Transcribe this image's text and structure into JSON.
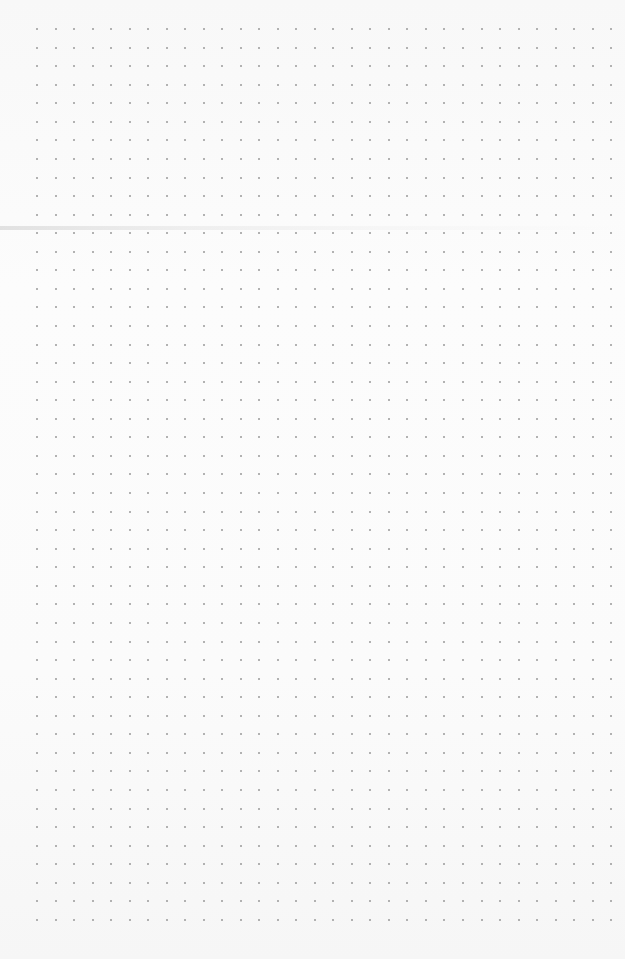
{
  "page": {
    "type": "dot-grid-paper",
    "background_color": "#fbfbfb",
    "dot_color": "#9a9a9a"
  },
  "grid": {
    "columns": 32,
    "rows": 49,
    "origin_x": 37,
    "origin_y": 29,
    "spacing_x": 18.52,
    "spacing_y": 18.56,
    "dot_size": 2
  },
  "fold_line": {
    "y": 228
  }
}
